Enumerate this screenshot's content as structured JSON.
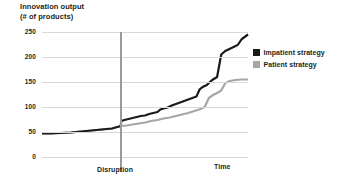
{
  "chart_data": {
    "type": "line",
    "title": "Innovation output",
    "subtitle": "(# of products)",
    "ylabel": "Innovation output (# of products)",
    "xlabel": "Time",
    "ylim": [
      0,
      250
    ],
    "yticks": [
      0,
      50,
      100,
      150,
      200,
      250
    ],
    "ytick_labels": [
      "0",
      "50",
      "100",
      "150",
      "200",
      "250"
    ],
    "grid": true,
    "legend_position": "right",
    "annotations": [
      {
        "name": "disruption",
        "label": "Disruption",
        "x": 0.384,
        "type": "vline"
      }
    ],
    "series": [
      {
        "name": "Impatient strategy",
        "color": "#1a1a1a",
        "x": [
          0.0,
          0.04,
          0.09,
          0.14,
          0.19,
          0.24,
          0.29,
          0.34,
          0.383,
          0.384,
          0.4,
          0.42,
          0.44,
          0.46,
          0.48,
          0.5,
          0.52,
          0.54,
          0.56,
          0.575,
          0.59,
          0.61,
          0.63,
          0.65,
          0.67,
          0.69,
          0.71,
          0.73,
          0.75,
          0.765,
          0.78,
          0.8,
          0.815,
          0.83,
          0.85,
          0.87,
          0.89,
          0.91,
          0.93,
          0.95,
          0.97,
          1.0
        ],
        "y": [
          47,
          47,
          48,
          49,
          51,
          53,
          55,
          57,
          62,
          72,
          74,
          76,
          78,
          80,
          82,
          83,
          86,
          88,
          90,
          95,
          97,
          99,
          103,
          106,
          109,
          112,
          115,
          118,
          121,
          135,
          140,
          144,
          150,
          155,
          160,
          205,
          212,
          216,
          220,
          224,
          236,
          245
        ]
      },
      {
        "name": "Patient strategy",
        "color": "#a6a6a6",
        "x": [
          0.0,
          0.04,
          0.09,
          0.14,
          0.19,
          0.24,
          0.29,
          0.34,
          0.384,
          0.41,
          0.44,
          0.47,
          0.5,
          0.53,
          0.56,
          0.59,
          0.62,
          0.65,
          0.68,
          0.71,
          0.74,
          0.77,
          0.79,
          0.81,
          0.83,
          0.85,
          0.87,
          0.89,
          0.91,
          0.94,
          0.97,
          1.0
        ],
        "y": [
          47,
          47,
          48,
          49,
          51,
          53,
          55,
          57,
          62,
          63,
          65,
          67,
          69,
          72,
          74,
          77,
          79,
          82,
          85,
          88,
          92,
          96,
          100,
          118,
          124,
          128,
          133,
          148,
          152,
          154,
          155,
          155
        ]
      }
    ]
  },
  "legend": {
    "items": [
      {
        "label": "Impatient strategy",
        "color": "#1a1a1a"
      },
      {
        "label": "Patient strategy",
        "color": "#a6a6a6"
      }
    ]
  },
  "labels": {
    "title_line1": "Innovation output",
    "title_line2": "(# of products)",
    "disruption": "Disruption",
    "time": "Time"
  }
}
